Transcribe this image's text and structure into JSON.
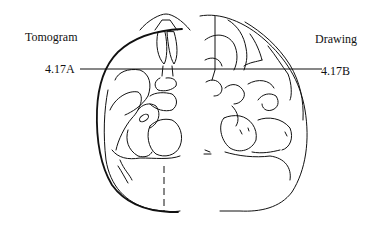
{
  "figure": {
    "left_panel_title": "Tomogram",
    "right_panel_title": "Drawing",
    "section_line": {
      "left_label": "4.17A",
      "right_label": "4.17B"
    },
    "line_color": "#111111",
    "background_color": "#ffffff"
  }
}
